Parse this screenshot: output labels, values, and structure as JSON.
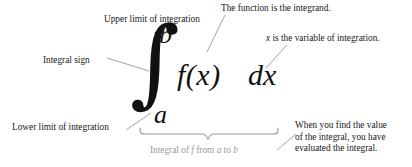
{
  "diagram": {
    "background_color": "#ffffff",
    "text_color": "#171717",
    "muted_color": "#9a9a9a",
    "leader_line_color": "#8c8c8c"
  },
  "formula": {
    "integral_sign": "∫",
    "upper_limit": "b",
    "lower_limit": "a",
    "integrand": "f(x)",
    "differential": "dx"
  },
  "callouts": {
    "upper_limit_label": "Upper limit of integration",
    "function_label": "The function is the integrand.",
    "variable_label_prefix": "x",
    "variable_label_rest": " is the variable of integration.",
    "integral_sign_label": "Integral sign",
    "lower_limit_label": "Lower limit of integration",
    "result_line_1": "When you find the value",
    "result_line_2": "of the integral, you have",
    "result_line_3": "evaluated the integral."
  },
  "brace_caption": {
    "part_1": "Integral of ",
    "var_f": "f",
    "part_2": " from ",
    "var_a": "a",
    "part_3": " to ",
    "var_b": "b"
  }
}
